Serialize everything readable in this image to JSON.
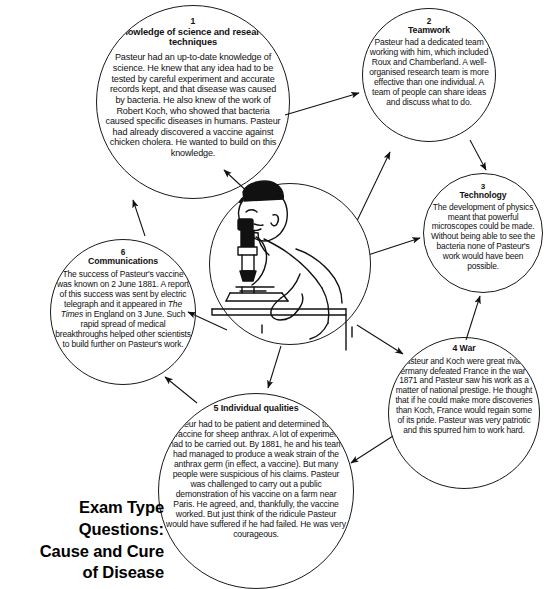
{
  "title": {
    "line1": "Exam Type",
    "line2": "Questions:",
    "line3": "Cause and Cure",
    "line4": "of Disease",
    "full": "Exam Type Questions: Cause and Cure of Disease"
  },
  "center": {
    "illustration_name": "scientist-at-microscope",
    "description": "Line drawing of Louis Pasteur in a lab coat bending over a microscope at a bench"
  },
  "nodes": [
    {
      "num": "1",
      "heading": "Knowledge of science and research techniques",
      "body": "Pasteur had an up-to-date knowledge of science. He knew that any idea had to be tested by careful experiment and accurate records kept, and that disease was caused by bacteria. He also knew of the work of Robert Koch, who showed that bacteria caused specific diseases in humans. Pasteur had already discovered a vaccine against chicken cholera. He wanted to build on this knowledge."
    },
    {
      "num": "2",
      "heading": "Teamwork",
      "body": "Pasteur had a dedicated team working with him, which included Roux and Chamberland. A well-organised research team is more effective than one individual. A team of people can share ideas and discuss what to do."
    },
    {
      "num": "3",
      "heading": "Technology",
      "body": "The development of physics meant that powerful microscopes could be made. Without being able to see the bacteria none of Pasteur's work would have been possible."
    },
    {
      "num": "4",
      "heading": "4 War",
      "body": "Pasteur and Koch were great rivals. Germany defeated France in the war in 1871 and Pasteur saw his work as a matter of national prestige. He thought that if he could make more discoveries than Koch, France would regain some of its pride. Pasteur was very patriotic and this spurred him to work hard."
    },
    {
      "num": "5",
      "heading": "5 Individual qualities",
      "body": "Pasteur had to be patient and determined to find a vaccine for sheep anthrax. A lot of experiments had to be carried out. By 1881, he and his team had managed to produce a weak strain of the anthrax germ (in effect, a vaccine). But many people were suspicious of his claims. Pasteur was challenged to carry out a public demonstration of his vaccine on a farm near Paris. He agreed, and, thankfully, the vaccine worked. But just think of the ridicule Pasteur would have suffered if he had failed. He was very courageous."
    },
    {
      "num": "6",
      "heading": "Communications",
      "body_pre": "The success of Pasteur's vaccine was known on 2 June 1881. A report of this success was sent by electric telegraph and it appeared in ",
      "body_italic": "The Times",
      "body_post": " in England on 3 June. Such rapid spread of medical breakthroughs helped other scientists to build further on Pasteur's work."
    }
  ],
  "connections": [
    {
      "from": "node-1",
      "to": "node-2"
    },
    {
      "from": "node-2",
      "to": "node-3"
    },
    {
      "from": "center",
      "to": "node-1"
    },
    {
      "from": "center",
      "to": "node-2"
    },
    {
      "from": "center",
      "to": "node-3"
    },
    {
      "from": "center",
      "to": "node-4"
    },
    {
      "from": "center",
      "to": "node-5"
    },
    {
      "from": "center",
      "to": "node-6"
    },
    {
      "from": "node-4",
      "to": "node-3"
    },
    {
      "from": "node-4",
      "to": "node-5"
    },
    {
      "from": "node-5",
      "to": "node-6"
    },
    {
      "from": "node-6",
      "to": "node-1"
    }
  ],
  "colors": {
    "stroke": "#1a1a1a",
    "text": "#111111",
    "background": "#ffffff"
  }
}
